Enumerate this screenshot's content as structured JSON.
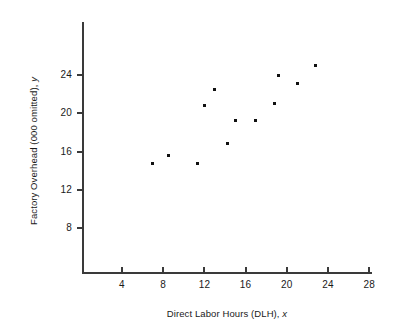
{
  "chart_data": {
    "type": "scatter",
    "title": "",
    "xlabel": "Direct Labor Hours (DLH), x",
    "ylabel": "Factory Overhead (000 omitted), y",
    "xlabel_main": "Direct Labor Hours (DLH),",
    "xlabel_var": "x",
    "ylabel_main": "Factory Overhead (000 omitted),",
    "ylabel_var": "y",
    "xlim": [
      0,
      30
    ],
    "ylim": [
      0,
      27
    ],
    "xticks": [
      4,
      8,
      12,
      16,
      20,
      24,
      28
    ],
    "xtick_labels": [
      "4",
      "8",
      "12",
      "16",
      "20",
      "24",
      "28"
    ],
    "yticks": [
      8,
      12,
      16,
      20,
      24
    ],
    "ytick_labels": [
      "8",
      "12",
      "16",
      "20",
      "24"
    ],
    "grid": false,
    "legend": false,
    "marker": "square",
    "marker_color": "#111111",
    "axis_color": "#3a3a3a",
    "background_color": "#ffffff",
    "points": [
      {
        "x": 7.0,
        "y": 14.8
      },
      {
        "x": 8.5,
        "y": 15.6
      },
      {
        "x": 11.3,
        "y": 14.8
      },
      {
        "x": 12.0,
        "y": 20.8
      },
      {
        "x": 13.0,
        "y": 22.5
      },
      {
        "x": 14.2,
        "y": 16.9
      },
      {
        "x": 15.0,
        "y": 19.3
      },
      {
        "x": 17.0,
        "y": 19.3
      },
      {
        "x": 18.8,
        "y": 21.0
      },
      {
        "x": 19.2,
        "y": 24.0
      },
      {
        "x": 21.0,
        "y": 23.1
      },
      {
        "x": 22.8,
        "y": 25.0
      }
    ]
  }
}
